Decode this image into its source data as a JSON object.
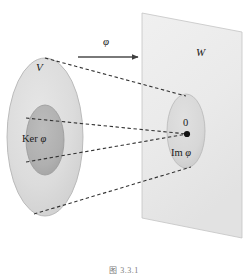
{
  "figure": {
    "caption": "图 3.3.1"
  },
  "labels": {
    "domain_set": "V",
    "codomain_plane": "W",
    "map_arrow": "φ",
    "kernel_prefix": "Ker",
    "kernel_phi": "φ",
    "zero_element": "0",
    "image_prefix": "Im",
    "image_phi": "φ"
  },
  "colors": {
    "domain_fill": "#dcdcdc",
    "kernel_fill": "#b2b2b2",
    "plane_fill": "#ececec",
    "image_fill": "#d8d8d8",
    "outline": "#9a9a9a",
    "dashed_line": "#3a3a3a",
    "arrow": "#4d4d4d",
    "text": "#1a1a1a",
    "background": "#ffffff"
  },
  "geometry": {
    "domain_ellipse": {
      "cx": 45,
      "cy": 137,
      "rx": 38,
      "ry": 79
    },
    "kernel_ellipse": {
      "cx": 45,
      "cy": 140,
      "rx": 19,
      "ry": 35
    },
    "image_ellipse": {
      "cx": 186,
      "cy": 131,
      "rx": 19,
      "ry": 37
    },
    "zero_point": {
      "x": 187,
      "y": 134
    },
    "plane_points": "142,13 242,32 242,238 142,218",
    "arrow": {
      "x1": 78,
      "y1": 57,
      "x2": 140,
      "y2": 57
    },
    "dashed_lines": [
      {
        "x1": 45,
        "y1": 58,
        "x2": 186,
        "y2": 96
      },
      {
        "x1": 26,
        "y1": 118,
        "x2": 187,
        "y2": 134
      },
      {
        "x1": 26,
        "y1": 162,
        "x2": 187,
        "y2": 134
      },
      {
        "x1": 34,
        "y1": 214,
        "x2": 190,
        "y2": 168
      }
    ]
  }
}
